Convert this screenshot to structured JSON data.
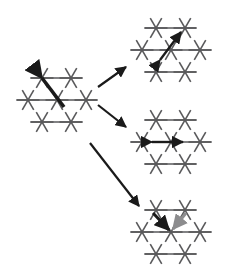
{
  "figure": {
    "title": "",
    "type": "lattice-transition-diagram",
    "background_color": "#ffffff",
    "width": 228,
    "height": 271
  },
  "style": {
    "lattice_line_color": "#59595b",
    "lattice_line_width": 1.6,
    "highlight_dark_color": "#1a1a1a",
    "highlight_gray_color": "#8c8c8e",
    "transition_arrow_color": "#1a1a1a",
    "transition_arrow_width": 2.2,
    "star_arm_length": 11.5,
    "vertex_spacing_x": 29,
    "vertex_spacing_y": 22
  },
  "lattices": [
    {
      "id": "source-lattice",
      "name": "source-state-lattice",
      "label": "",
      "origin": {
        "x": 14,
        "y": 62
      },
      "rows": [
        {
          "y": 16,
          "x_positions": [
            28,
            57
          ]
        },
        {
          "y": 38,
          "x_positions": [
            14,
            43,
            72
          ]
        },
        {
          "y": 60,
          "x_positions": [
            28,
            57
          ]
        }
      ],
      "highlights": [
        {
          "name": "dimer-highlight-diagonal",
          "kind": "thick-segment",
          "color": "#1a1a1a",
          "x1": 28,
          "y1": 16,
          "x2": 50,
          "y2": 45,
          "width": 3.6,
          "arrowhead": "start"
        }
      ]
    },
    {
      "id": "result-lattice-top",
      "name": "result-lattice-top",
      "label": "",
      "origin": {
        "x": 128,
        "y": 12
      },
      "rows": [
        {
          "y": 16,
          "x_positions": [
            28,
            57
          ]
        },
        {
          "y": 38,
          "x_positions": [
            14,
            43,
            72
          ]
        },
        {
          "y": 60,
          "x_positions": [
            28,
            57
          ]
        }
      ],
      "highlights": [
        {
          "name": "double-arrow-diagonal",
          "kind": "double-arrow",
          "color": "#1a1a1a",
          "x1": 32,
          "y1": 48,
          "x2": 53,
          "y2": 20,
          "width": 2.4,
          "arrowhead": "both"
        }
      ]
    },
    {
      "id": "result-lattice-middle",
      "name": "result-lattice-middle",
      "label": "",
      "origin": {
        "x": 128,
        "y": 104
      },
      "rows": [
        {
          "y": 16,
          "x_positions": [
            28,
            57
          ]
        },
        {
          "y": 38,
          "x_positions": [
            14,
            43,
            72
          ]
        },
        {
          "y": 60,
          "x_positions": [
            28,
            57
          ]
        }
      ],
      "highlights": [
        {
          "name": "double-arrow-horizontal",
          "kind": "double-arrow",
          "color": "#1a1a1a",
          "x1": 24,
          "y1": 38,
          "x2": 55,
          "y2": 38,
          "width": 2.4,
          "arrowhead": "both"
        }
      ]
    },
    {
      "id": "result-lattice-bottom",
      "name": "result-lattice-bottom",
      "label": "",
      "origin": {
        "x": 128,
        "y": 194
      },
      "rows": [
        {
          "y": 16,
          "x_positions": [
            28,
            57
          ]
        },
        {
          "y": 38,
          "x_positions": [
            14,
            43,
            72
          ]
        },
        {
          "y": 60,
          "x_positions": [
            28,
            57
          ]
        }
      ],
      "highlights": [
        {
          "name": "dark-arrow-in-left",
          "kind": "arrow",
          "color": "#1a1a1a",
          "x1": 25,
          "y1": 19,
          "x2": 41,
          "y2": 36,
          "width": 3.0,
          "arrowhead": "end"
        },
        {
          "name": "gray-arrow-in-right",
          "kind": "arrow",
          "color": "#8c8c8e",
          "x1": 58,
          "y1": 19,
          "x2": 45,
          "y2": 35,
          "width": 3.0,
          "arrowhead": "end"
        }
      ]
    }
  ],
  "transitions": [
    {
      "id": "transition-up",
      "name": "transition-arrow-to-top",
      "label": "",
      "from": {
        "x": 98,
        "y": 87
      },
      "to": {
        "x": 126,
        "y": 67
      }
    },
    {
      "id": "transition-right",
      "name": "transition-arrow-to-middle",
      "label": "",
      "from": {
        "x": 98,
        "y": 105
      },
      "to": {
        "x": 126,
        "y": 127
      }
    },
    {
      "id": "transition-down",
      "name": "transition-arrow-to-bottom",
      "label": "",
      "from": {
        "x": 90,
        "y": 143
      },
      "to": {
        "x": 139,
        "y": 206
      }
    }
  ]
}
